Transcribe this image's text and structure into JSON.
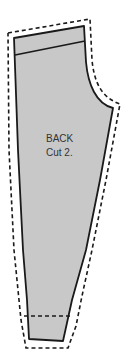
{
  "pattern": {
    "piece_name": "BACK",
    "cut_instruction": "Cut 2.",
    "fill_color": "#c8c8c8",
    "stroke_color": "#1a1a1a",
    "seam_allowance_style": "dashed"
  }
}
